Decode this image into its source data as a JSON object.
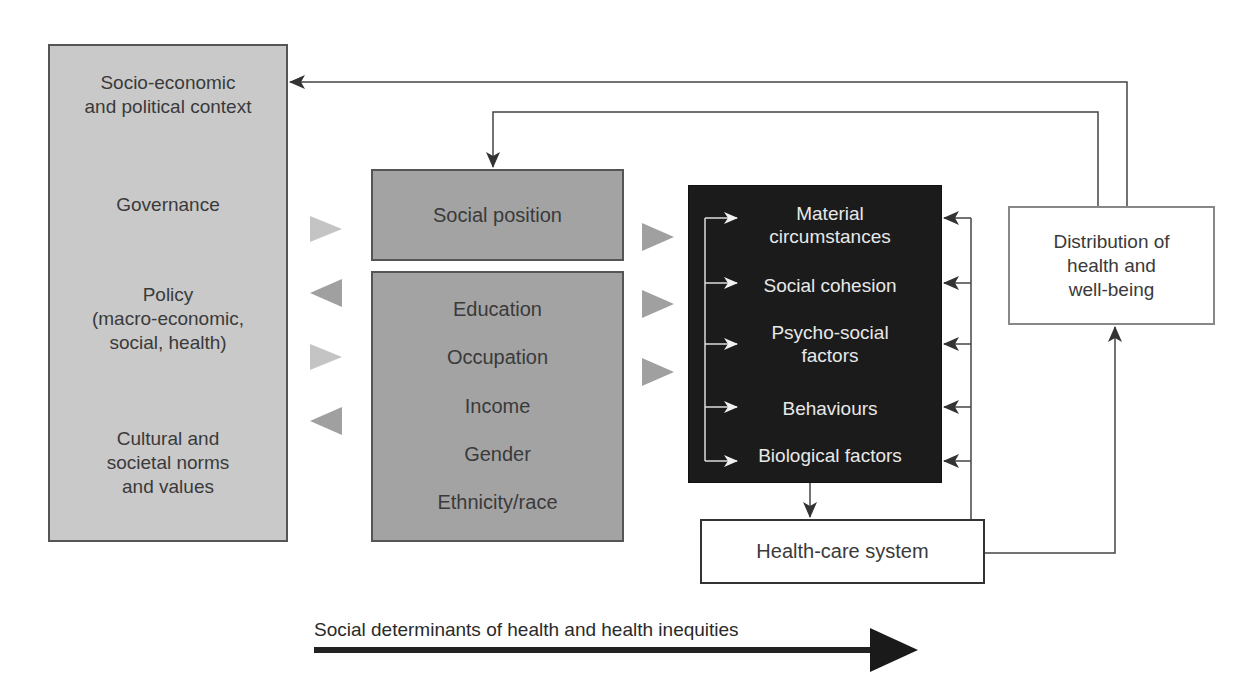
{
  "context_box": {
    "items": [
      "Socio-economic\nand political context",
      "Governance",
      "Policy\n(macro-economic,\nsocial, health)",
      "Cultural and\nsocietal norms\nand values"
    ]
  },
  "social_position_box": {
    "label": "Social position"
  },
  "stratifiers_box": {
    "items": [
      "Education",
      "Occupation",
      "Income",
      "Gender",
      "Ethnicity/race"
    ]
  },
  "intermediary_box": {
    "items": [
      "Material\ncircumstances",
      "Social cohesion",
      "Psycho-social\nfactors",
      "Behaviours",
      "Biological factors"
    ]
  },
  "distribution_box": {
    "label": "Distribution of\nhealth and\nwell-being"
  },
  "health_care_box": {
    "label": "Health-care system"
  },
  "bottom_arrow": {
    "label": "Social determinants of health and health inequities"
  },
  "colors": {
    "context_fill": "#c9c9c9",
    "position_fill": "#a3a3a3",
    "intermediary_fill": "#1b1b1b",
    "light_arrow": "#c4c4c4",
    "mid_arrow": "#a0a0a0",
    "line": "#444444"
  }
}
